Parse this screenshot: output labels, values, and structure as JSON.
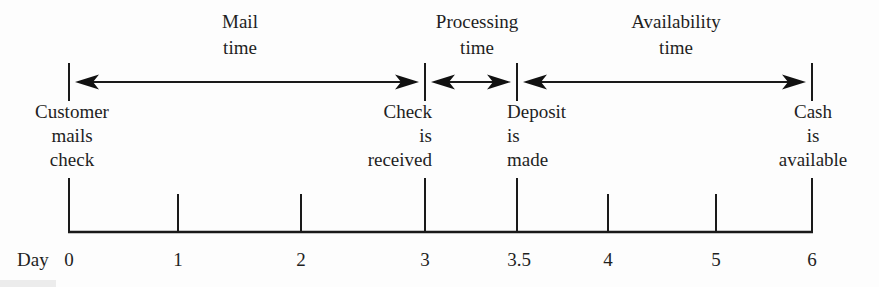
{
  "timeline": {
    "description": "Check collection float timeline",
    "intervals": [
      {
        "name": "Mail time",
        "line1": "Mail",
        "line2": "time",
        "from_day": 0,
        "to_day": 3
      },
      {
        "name": "Processing time",
        "line1": "Processing",
        "line2": "time",
        "from_day": 3,
        "to_day": 3.5
      },
      {
        "name": "Availability time",
        "line1": "Availability",
        "line2": "time",
        "from_day": 3.5,
        "to_day": 6
      }
    ],
    "events": [
      {
        "day": 0,
        "line1": "Customer",
        "line2": "mails",
        "line3": "check"
      },
      {
        "day": 3,
        "line1": "Check",
        "line2": "is",
        "line3": "received"
      },
      {
        "day": 3.5,
        "line1": "Deposit",
        "line2": "is",
        "line3": "made"
      },
      {
        "day": 6,
        "line1": "Cash",
        "line2": "is",
        "line3": "available"
      }
    ],
    "axis": {
      "label": "Day",
      "ticks": [
        "0",
        "1",
        "2",
        "3",
        "3.5",
        "4",
        "5",
        "6"
      ]
    },
    "colors": {
      "line": "#1a1a1a",
      "text": "#1f1f1f",
      "background": "#fdfdfd"
    }
  }
}
